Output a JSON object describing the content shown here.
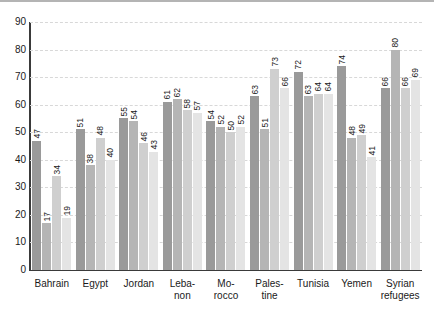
{
  "chart_data": {
    "type": "bar",
    "title": "",
    "subtitle": "",
    "xlabel": "",
    "ylabel": "",
    "ylim": [
      0,
      90
    ],
    "ytick_step": 10,
    "yticks": [
      90,
      80,
      70,
      60,
      50,
      40,
      30,
      20,
      10,
      0
    ],
    "grid": true,
    "grid_style": "dashed-horizontal",
    "legend": null,
    "legend_position": "none",
    "series_count": 4,
    "series_colors": [
      "#9a9a9a",
      "#b5b5b5",
      "#cfcfcf",
      "#e4e4e4"
    ],
    "categories": [
      "Bahrain",
      "Egypt",
      "Jordan",
      "Leba-\nnon",
      "Mo-\nrocco",
      "Pales-\ntine",
      "Tunisia",
      "Yemen",
      "Syrian\nrefugees"
    ],
    "category_lines": [
      [
        "Bahrain"
      ],
      [
        "Egypt"
      ],
      [
        "Jordan"
      ],
      [
        "Leba-",
        "non"
      ],
      [
        "Mo-",
        "rocco"
      ],
      [
        "Pales-",
        "tine"
      ],
      [
        "Tunisia"
      ],
      [
        "Yemen"
      ],
      [
        "Syrian",
        "refugees"
      ]
    ],
    "series": [
      {
        "name": "series-1",
        "color": "#9a9a9a",
        "values": [
          47,
          51,
          55,
          61,
          54,
          63,
          72,
          74,
          66
        ]
      },
      {
        "name": "series-2",
        "color": "#b5b5b5",
        "values": [
          17,
          38,
          54,
          62,
          52,
          51,
          63,
          48,
          80
        ]
      },
      {
        "name": "series-3",
        "color": "#cfcfcf",
        "values": [
          34,
          48,
          46,
          58,
          50,
          73,
          64,
          49,
          66
        ]
      },
      {
        "name": "series-4",
        "color": "#e4e4e4",
        "values": [
          19,
          40,
          43,
          57,
          52,
          66,
          64,
          41,
          69
        ]
      }
    ],
    "groups": [
      {
        "category": "Bahrain",
        "values": [
          47,
          17,
          34,
          19
        ]
      },
      {
        "category": "Egypt",
        "values": [
          51,
          38,
          48,
          40
        ]
      },
      {
        "category": "Jordan",
        "values": [
          55,
          54,
          46,
          43
        ]
      },
      {
        "category": "Lebanon",
        "values": [
          61,
          62,
          58,
          57
        ]
      },
      {
        "category": "Morocco",
        "values": [
          54,
          52,
          50,
          52
        ]
      },
      {
        "category": "Palestine",
        "values": [
          63,
          51,
          73,
          66
        ]
      },
      {
        "category": "Tunisia",
        "values": [
          72,
          63,
          64,
          64
        ]
      },
      {
        "category": "Yemen",
        "values": [
          74,
          48,
          49,
          41
        ]
      },
      {
        "category": "Syrian refugees",
        "values": [
          66,
          80,
          66,
          69
        ]
      }
    ]
  },
  "axis": {
    "y_tick_labels": [
      "90",
      "80",
      "70",
      "60",
      "50",
      "40",
      "30",
      "20",
      "10",
      "0"
    ]
  },
  "colors": {
    "axis": "#3a3a3a",
    "grid": "#d8d8d8",
    "text": "#1a1a1a",
    "background": "#ffffff",
    "top_rule": "#b4b4b4"
  }
}
